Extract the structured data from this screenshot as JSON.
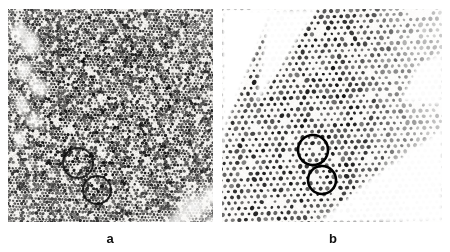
{
  "figure": {
    "kind": "electron-micrograph-figure",
    "width": 450,
    "height": 252,
    "background_color": "#ffffff",
    "panel_count": 2
  },
  "panels": [
    {
      "id": "a",
      "label": "a",
      "label_x": 110,
      "label_y": 232,
      "label_font_size": 13,
      "frame": {
        "x": 8,
        "y": 9,
        "width": 205,
        "height": 213
      },
      "appearance": {
        "description": "dark dense high-contrast fine-grained lattice",
        "base_color": "#f2f0ec",
        "dot_color": "#101010",
        "mean_gray": 95,
        "contrast": "high",
        "lattice_spacing_px": 3.4,
        "lattice_angle_deg": 62,
        "dot_radius_px": 1.35,
        "dot_fill_ratio": 0.82,
        "noise_amount": 0.55,
        "vignette": 0.22,
        "seed": 20931
      },
      "bright_blobs": [
        {
          "cx": 22,
          "cy": 34,
          "rx": 13,
          "ry": 17,
          "rot": -22,
          "level": 0.96
        },
        {
          "cx": 16,
          "cy": 62,
          "rx": 10,
          "ry": 13,
          "rot": 14,
          "level": 0.92
        },
        {
          "cx": 30,
          "cy": 78,
          "rx": 14,
          "ry": 11,
          "rot": 38,
          "level": 0.9
        },
        {
          "cx": 14,
          "cy": 96,
          "rx": 9,
          "ry": 12,
          "rot": -8,
          "level": 0.88
        },
        {
          "cx": 26,
          "cy": 112,
          "rx": 11,
          "ry": 9,
          "rot": 26,
          "level": 0.85
        },
        {
          "cx": 12,
          "cy": 130,
          "rx": 8,
          "ry": 10,
          "rot": 0,
          "level": 0.8
        },
        {
          "cx": 11,
          "cy": 22,
          "rx": 9,
          "ry": 11,
          "rot": 40,
          "level": 0.93
        },
        {
          "cx": 186,
          "cy": 198,
          "rx": 22,
          "ry": 16,
          "rot": -18,
          "level": 0.94
        },
        {
          "cx": 205,
          "cy": 186,
          "rx": 14,
          "ry": 13,
          "rot": 12,
          "level": 0.9
        },
        {
          "cx": 168,
          "cy": 212,
          "rx": 17,
          "ry": 10,
          "rot": -30,
          "level": 0.86
        },
        {
          "cx": 205,
          "cy": 215,
          "rx": 12,
          "ry": 10,
          "rot": 10,
          "level": 0.88
        }
      ],
      "dark_blobs": [
        {
          "cx": 60,
          "cy": 150,
          "rx": 30,
          "ry": 26,
          "rot": 0,
          "level": 0.35
        },
        {
          "cx": 120,
          "cy": 120,
          "rx": 46,
          "ry": 40,
          "rot": 0,
          "level": 0.25
        }
      ],
      "circle_annotations": [
        {
          "cx": 78,
          "cy": 163,
          "r": 15,
          "stroke_width": 2.0,
          "stroke": "#0b0b0b",
          "opacity": 0.85
        },
        {
          "cx": 97,
          "cy": 190,
          "r": 14,
          "stroke_width": 2.0,
          "stroke": "#0b0b0b",
          "opacity": 0.85
        }
      ]
    },
    {
      "id": "b",
      "label": "b",
      "label_x": 333,
      "label_y": 232,
      "label_font_size": 13,
      "frame": {
        "x": 222,
        "y": 9,
        "width": 220,
        "height": 213
      },
      "appearance": {
        "description": "light background with sparse resolved hexagonal dot lattice",
        "base_color": "#fbfaf8",
        "dot_color": "#151515",
        "mean_gray": 225,
        "contrast": "medium",
        "lattice_spacing_px": 6.6,
        "lattice_angle_deg": 58,
        "dot_radius_px": 1.7,
        "dot_fill_ratio": 0.95,
        "noise_amount": 0.12,
        "vignette": 0.1,
        "seed": 47711
      },
      "white_wedges": [
        {
          "points": "0,0 52,0 6,112 0,150",
          "level": 1.0
        },
        {
          "points": "46,0 96,0 34,96",
          "level": 0.98
        },
        {
          "points": "150,168 220,120 220,213 96,213",
          "level": 0.97
        },
        {
          "points": "196,56 220,44 220,96 178,92",
          "level": 0.95
        }
      ],
      "fade_gradient": {
        "from_x": 130,
        "to_x": 220,
        "from_alpha": 0.0,
        "to_alpha": 0.72
      },
      "circle_annotations": [
        {
          "cx": 313,
          "cy": 150,
          "r": 15,
          "stroke_width": 2.6,
          "stroke": "#000000",
          "opacity": 1.0
        },
        {
          "cx": 322,
          "cy": 180,
          "r": 14,
          "stroke_width": 2.6,
          "stroke": "#000000",
          "opacity": 1.0
        }
      ]
    }
  ],
  "annotations": {
    "circle_marker_name": "defect-circle-marker",
    "total_circles": 4,
    "circle_meaning": "highlighted lattice defect / region of interest"
  }
}
